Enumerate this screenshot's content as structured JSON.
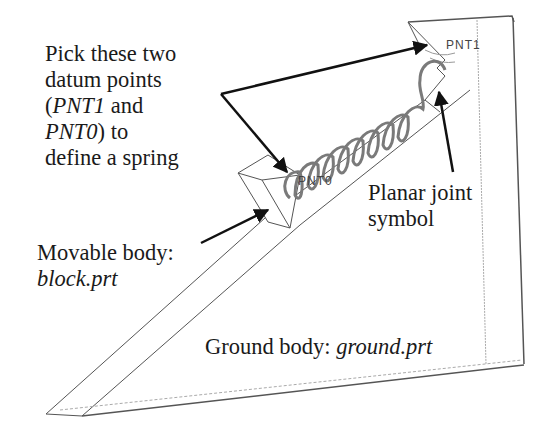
{
  "figure": {
    "annotations": {
      "pick_points": {
        "lines": [
          "Pick these two",
          "datum points",
          "(",
          "PNT1",
          " and",
          "PNT0",
          ") to",
          "define a spring"
        ]
      },
      "movable_body": {
        "prefix": "Movable body:",
        "file": "block.prt"
      },
      "planar_joint": {
        "line1": "Planar joint",
        "line2": "symbol"
      },
      "ground_body": {
        "prefix": "Ground body: ",
        "file": "ground.prt"
      }
    },
    "datum_points": {
      "pnt1": "PNT1",
      "pnt0": "PNT0"
    },
    "colors": {
      "outline": "#555555",
      "arrow": "#111111",
      "spring": "#7a7a7a",
      "text": "#1a1a1a"
    }
  }
}
